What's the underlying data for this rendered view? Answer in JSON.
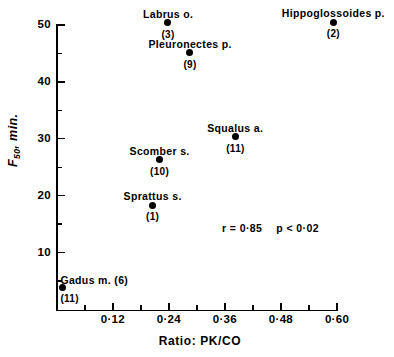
{
  "chart_data": {
    "type": "scatter",
    "title": "",
    "xlabel": "Ratio: PK/CO",
    "ylabel": "F50, min.",
    "ylabel_base": "F",
    "ylabel_sub": "50",
    "ylabel_rest": ", min.",
    "xlim": [
      0.0,
      0.6
    ],
    "ylim": [
      0,
      50
    ],
    "grid": false,
    "legend": "none",
    "x_ticks_major": [
      0.12,
      0.24,
      0.36,
      0.48,
      0.6
    ],
    "x_ticklabels": [
      "0·12",
      "0·24",
      "0·36",
      "0·48",
      "0·60"
    ],
    "x_ticks_minor": [
      0.06,
      0.18,
      0.3,
      0.42,
      0.54
    ],
    "y_ticks_major": [
      10,
      20,
      30,
      40,
      50
    ],
    "y_ticklabels": [
      "10",
      "20",
      "30",
      "40",
      "50"
    ],
    "y_ticks_minor": [
      5,
      15,
      25,
      35,
      45
    ],
    "points": [
      {
        "label": "Gadus m. (6)",
        "count": "(11)",
        "x": 0.012,
        "y": 3.8,
        "label_pos": "above-right",
        "count_pos": "below-right"
      },
      {
        "label": "Sprattus s.",
        "count": "(1)",
        "x": 0.205,
        "y": 18.3,
        "label_pos": "above",
        "count_pos": "below"
      },
      {
        "label": "Scomber s.",
        "count": "(10)",
        "x": 0.22,
        "y": 26.3,
        "label_pos": "above",
        "count_pos": "below"
      },
      {
        "label": "Labrus o.",
        "count": "(3)",
        "x": 0.238,
        "y": 50.4,
        "label_pos": "above",
        "count_pos": "below"
      },
      {
        "label": "Pleuronectes p.",
        "count": "(9)",
        "x": 0.285,
        "y": 45.1,
        "label_pos": "above",
        "count_pos": "below"
      },
      {
        "label": "Squalus a.",
        "count": "(11)",
        "x": 0.382,
        "y": 30.4,
        "label_pos": "above",
        "count_pos": "below"
      },
      {
        "label": "Hippoglossoides p.",
        "count": "(2)",
        "x": 0.592,
        "y": 50.5,
        "label_pos": "above",
        "count_pos": "below"
      }
    ],
    "annotations": {
      "r_text": "r = 0·85",
      "p_text": "p < 0·02",
      "r_value": 0.85,
      "p_value": "< 0.02"
    }
  },
  "colors": {
    "background": "#ffffff",
    "ink": "#000000",
    "marker": "#000000"
  }
}
